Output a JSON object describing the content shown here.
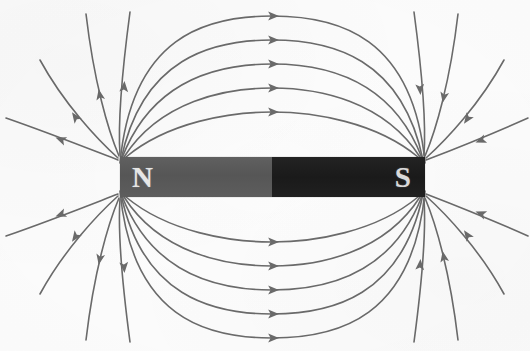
{
  "figure": {
    "width": 530,
    "height": 351,
    "background_color": "#fdfdfd",
    "line_color": "#6b6b6b",
    "line_width": 1.6
  },
  "magnet": {
    "name": "bar-magnet",
    "x": 120,
    "y": 157,
    "width": 305,
    "height": 40,
    "north": {
      "label": "N",
      "color": "#5a5a5a",
      "text_color": "#e6e6e6",
      "width": 152
    },
    "south": {
      "label": "S",
      "color": "#1e1e1e",
      "text_color": "#d9d9d9",
      "width": 153
    }
  },
  "chart_data": {
    "type": "line",
    "xlabel": "",
    "ylabel": "",
    "xlim": [
      0,
      530
    ],
    "ylim": [
      0,
      351
    ],
    "grid": false,
    "legend": null,
    "annotations": [
      "N",
      "S"
    ],
    "field_direction": "from N pole to S pole (arrows point away from N, toward S)",
    "pole_positions": {
      "north_tip_x": 120,
      "south_tip_x": 425,
      "axis_y": 177
    },
    "series": [
      {
        "name": "loop-1",
        "d": "M 126 157 C 168 122 230 112 272 112 C 314 112 376 122 418 157",
        "arrows": [
          {
            "x": 272,
            "y": 112,
            "angle": 0
          }
        ]
      },
      {
        "name": "loop-2",
        "d": "M 124 157 C 160 101 225 88 272 88 C 319 88 384 101 420 157",
        "arrows": [
          {
            "x": 272,
            "y": 88,
            "angle": 0
          }
        ]
      },
      {
        "name": "loop-3",
        "d": "M 122 158 C 152 80 218 64 272 64 C 326 64 392 80 422 158",
        "arrows": [
          {
            "x": 272,
            "y": 64,
            "angle": 0
          }
        ]
      },
      {
        "name": "loop-4",
        "d": "M 121 160 C 142 58 212 40 272 40 C 332 40 402 58 423 160",
        "arrows": [
          {
            "x": 272,
            "y": 40,
            "angle": 0
          }
        ]
      },
      {
        "name": "loop-5",
        "d": "M 120 163 C 132 36 206 16 272 16 C 338 16 413 36 425 163",
        "arrows": [
          {
            "x": 272,
            "y": 16,
            "angle": 0
          }
        ]
      },
      {
        "name": "loop-1b",
        "d": "M 126 197 C 168 232 230 242 272 242 C 314 242 376 232 418 197",
        "arrows": [
          {
            "x": 272,
            "y": 242,
            "angle": 0
          }
        ]
      },
      {
        "name": "loop-2b",
        "d": "M 124 197 C 160 253 225 266 272 266 C 319 266 384 253 420 197",
        "arrows": [
          {
            "x": 272,
            "y": 266,
            "angle": 0
          }
        ]
      },
      {
        "name": "loop-3b",
        "d": "M 122 196 C 152 274 218 290 272 290 C 326 290 392 274 422 196",
        "arrows": [
          {
            "x": 272,
            "y": 290,
            "angle": 0
          }
        ]
      },
      {
        "name": "loop-4b",
        "d": "M 121 194 C 142 296 212 314 272 314 C 332 314 402 296 423 194",
        "arrows": [
          {
            "x": 272,
            "y": 314,
            "angle": 0
          }
        ]
      },
      {
        "name": "loop-5b",
        "d": "M 120 191 C 132 318 206 338 272 338 C 338 338 413 318 425 191",
        "arrows": [
          {
            "x": 272,
            "y": 338,
            "angle": 0
          }
        ]
      },
      {
        "name": "fan-left-up-1",
        "d": "M 118 158 C 98 140 64 104 40 60",
        "arrows": [
          {
            "x": 76,
            "y": 118,
            "angle": -125
          }
        ]
      },
      {
        "name": "fan-left-up-2",
        "d": "M 118 160 C 92 150 52 134 6 118",
        "arrows": [
          {
            "x": 62,
            "y": 140,
            "angle": -159
          }
        ]
      },
      {
        "name": "fan-left-up-3",
        "d": "M 119 156 C 108 130 94 82 86 14",
        "arrows": [
          {
            "x": 100,
            "y": 96,
            "angle": -101
          }
        ]
      },
      {
        "name": "fan-left-up-4",
        "d": "M 120 155 C 118 126 122 72 130 12",
        "arrows": [
          {
            "x": 124,
            "y": 88,
            "angle": -86
          }
        ]
      },
      {
        "name": "fan-left-down-1",
        "d": "M 118 196 C 98 214 64 250 40 294",
        "arrows": [
          {
            "x": 76,
            "y": 236,
            "angle": 125
          }
        ]
      },
      {
        "name": "fan-left-down-2",
        "d": "M 118 194 C 92 204 52 220 6 236",
        "arrows": [
          {
            "x": 62,
            "y": 214,
            "angle": 159
          }
        ]
      },
      {
        "name": "fan-left-down-3",
        "d": "M 119 198 C 108 224 94 272 86 340",
        "arrows": [
          {
            "x": 100,
            "y": 258,
            "angle": 101
          }
        ]
      },
      {
        "name": "fan-left-down-4",
        "d": "M 120 199 C 118 228 122 282 130 342",
        "arrows": [
          {
            "x": 124,
            "y": 266,
            "angle": 86
          }
        ]
      },
      {
        "name": "fan-right-up-1",
        "d": "M 504 60 C 480 104 446 140 426 158",
        "arrows": [
          {
            "x": 468,
            "y": 118,
            "angle": 125
          }
        ]
      },
      {
        "name": "fan-right-up-2",
        "d": "M 528 118 C 492 134 452 150 426 160",
        "arrows": [
          {
            "x": 482,
            "y": 140,
            "angle": 159
          }
        ]
      },
      {
        "name": "fan-right-up-3",
        "d": "M 458 14 C 450 82 436 130 425 156",
        "arrows": [
          {
            "x": 444,
            "y": 96,
            "angle": 101
          }
        ]
      },
      {
        "name": "fan-right-up-4",
        "d": "M 414 12 C 422 72 426 126 424 155",
        "arrows": [
          {
            "x": 420,
            "y": 88,
            "angle": 86
          }
        ]
      },
      {
        "name": "fan-right-down-1",
        "d": "M 504 294 C 480 250 446 214 426 196",
        "arrows": [
          {
            "x": 468,
            "y": 236,
            "angle": -125
          }
        ]
      },
      {
        "name": "fan-right-down-2",
        "d": "M 528 236 C 492 220 452 204 426 194",
        "arrows": [
          {
            "x": 482,
            "y": 214,
            "angle": -159
          }
        ]
      },
      {
        "name": "fan-right-down-3",
        "d": "M 458 340 C 450 272 436 224 425 198",
        "arrows": [
          {
            "x": 444,
            "y": 258,
            "angle": -101
          }
        ]
      },
      {
        "name": "fan-right-down-4",
        "d": "M 414 342 C 422 282 426 228 424 199",
        "arrows": [
          {
            "x": 420,
            "y": 266,
            "angle": -86
          }
        ]
      }
    ]
  }
}
